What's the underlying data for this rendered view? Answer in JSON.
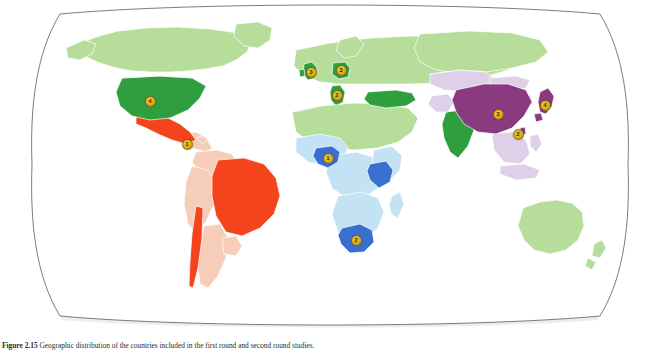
{
  "figure": {
    "caption_label": "Figure 2.15",
    "caption_text": "Geographic distribution of the countries included in the first round and second round studies.",
    "alt_title": "World map showing study countries by region"
  },
  "map": {
    "projection": "winkel-tripel",
    "background_color": "#ffffff",
    "frame_color": "#6b6b7a",
    "default_land_color": "#b7dd9b",
    "border_color": "#ffffff",
    "ocean_color": "#ffffff",
    "shadow_color": "#ebebe4"
  },
  "legend_colors": {
    "americas_highlight": "#f4441c",
    "americas_light": "#f6cdb9",
    "europe_highlight": "#2f9e3f",
    "default_green": "#b7dd9b",
    "asia_highlight": "#8a3a7f",
    "asia_light": "#ded0e8",
    "africa_highlight": "#3a6fd0",
    "africa_light": "#c3e3f5"
  },
  "regions": [
    {
      "name": "united-states",
      "label": "United States",
      "color_key": "europe_highlight"
    },
    {
      "name": "canada",
      "label": "Canada",
      "color_key": "default_green"
    },
    {
      "name": "mexico",
      "label": "Mexico",
      "color_key": "americas_highlight"
    },
    {
      "name": "brazil",
      "label": "Brazil",
      "color_key": "americas_highlight"
    },
    {
      "name": "chile",
      "label": "Chile",
      "color_key": "americas_highlight"
    },
    {
      "name": "latin-america-other",
      "label": "Latin America (other)",
      "color_key": "americas_light"
    },
    {
      "name": "united-kingdom",
      "label": "United Kingdom",
      "color_key": "europe_highlight"
    },
    {
      "name": "germany",
      "label": "Germany",
      "color_key": "europe_highlight"
    },
    {
      "name": "italy",
      "label": "Italy",
      "color_key": "europe_highlight"
    },
    {
      "name": "turkey",
      "label": "Turkey",
      "color_key": "europe_highlight"
    },
    {
      "name": "india",
      "label": "India",
      "color_key": "europe_highlight"
    },
    {
      "name": "china",
      "label": "China",
      "color_key": "asia_highlight"
    },
    {
      "name": "japan",
      "label": "Japan",
      "color_key": "asia_highlight"
    },
    {
      "name": "south-east-asia",
      "label": "South & South-East Asia",
      "color_key": "asia_light"
    },
    {
      "name": "nigeria",
      "label": "Nigeria",
      "color_key": "africa_highlight"
    },
    {
      "name": "tanzania",
      "label": "Tanzania",
      "color_key": "africa_highlight"
    },
    {
      "name": "south-africa",
      "label": "South Africa",
      "color_key": "africa_highlight"
    },
    {
      "name": "sub-saharan-africa",
      "label": "Sub-Saharan Africa",
      "color_key": "africa_light"
    },
    {
      "name": "russia",
      "label": "Russia",
      "color_key": "default_green"
    },
    {
      "name": "australia",
      "label": "Australia",
      "color_key": "default_green"
    }
  ],
  "markers": [
    {
      "id": "marker-caribbean",
      "label": "1",
      "country": "Caribbean",
      "x": 187,
      "y": 144
    },
    {
      "id": "marker-united-states",
      "label": "4",
      "country": "United States",
      "x": 150,
      "y": 101
    },
    {
      "id": "marker-united-kingdom",
      "label": "3",
      "country": "United Kingdom",
      "x": 311,
      "y": 72
    },
    {
      "id": "marker-germany",
      "label": "3",
      "country": "Germany",
      "x": 341,
      "y": 70
    },
    {
      "id": "marker-italy",
      "label": "2",
      "country": "Italy",
      "x": 337,
      "y": 95
    },
    {
      "id": "marker-nigeria",
      "label": "1",
      "country": "Nigeria",
      "x": 328,
      "y": 158
    },
    {
      "id": "marker-south-africa",
      "label": "2",
      "country": "South Africa",
      "x": 356,
      "y": 240
    },
    {
      "id": "marker-china",
      "label": "3",
      "country": "China",
      "x": 498,
      "y": 114
    },
    {
      "id": "marker-hong-kong",
      "label": "2",
      "country": "Hong Kong / Taiwan",
      "x": 518,
      "y": 134
    },
    {
      "id": "marker-japan",
      "label": "4",
      "country": "Japan",
      "x": 545,
      "y": 105
    }
  ]
}
